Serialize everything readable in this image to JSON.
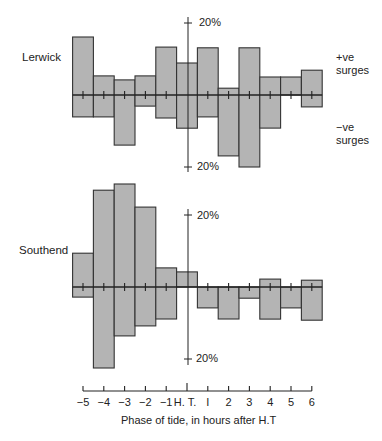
{
  "chart_data": {
    "type": "bar",
    "title": "",
    "xlabel": "Phase of tide, in hours after H.T",
    "ylabel": "",
    "x_tick_labels": [
      "-5",
      "-4",
      "-3",
      "-2",
      "-1",
      "H. T.",
      "I",
      "2",
      "3",
      "4",
      "5",
      "6"
    ],
    "x": [
      -5,
      -4,
      -3,
      -2,
      -1,
      0,
      1,
      2,
      3,
      4,
      5,
      6
    ],
    "scale_marker": "20%",
    "ylim": [
      -30,
      30
    ],
    "grid": false,
    "units": "% of surges",
    "panels": [
      {
        "name": "Lerwick",
        "series": [
          {
            "name": "+ve surges",
            "values": [
              16.1,
              5.3,
              4.2,
              5.3,
              13.3,
              8.9,
              13.1,
              1.9,
              13.1,
              5.0,
              5.0,
              6.9
            ]
          },
          {
            "name": "-ve surges",
            "values": [
              6.1,
              6.1,
              13.9,
              3.1,
              6.4,
              9.2,
              6.1,
              16.9,
              20.0,
              9.2,
              0.0,
              3.3
            ]
          }
        ]
      },
      {
        "name": "Southend",
        "series": [
          {
            "name": "+ve surges",
            "values": [
              9.4,
              26.9,
              28.6,
              22.2,
              5.3,
              4.2,
              0.0,
              0.0,
              0.0,
              2.2,
              0.0,
              1.9
            ]
          },
          {
            "name": "-ve surges",
            "values": [
              2.8,
              22.5,
              13.6,
              10.8,
              8.9,
              0.0,
              5.8,
              8.9,
              3.1,
              8.9,
              5.8,
              9.2
            ]
          }
        ]
      }
    ]
  },
  "labels": {
    "lerwick": "Lerwick",
    "southend": "Southend",
    "pos_surges_1": "+ve",
    "pos_surges_2": "surges",
    "neg_surges_1": "−ve",
    "neg_surges_2": "surges",
    "pct_top_lerwick": "20%",
    "pct_bottom_lerwick": "20%",
    "pct_top_southend": "20%",
    "pct_bottom_southend": "20%",
    "xaxis_title": "Phase of tide, in hours after H.T"
  },
  "colors": {
    "bar_fill": "#b4b4b4",
    "bar_stroke": "#333333",
    "axis": "#222222"
  }
}
